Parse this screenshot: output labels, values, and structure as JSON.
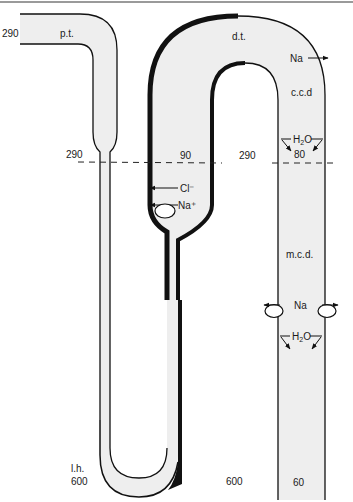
{
  "diagram": {
    "colors": {
      "tube_fill": "#eeeeee",
      "outline": "#111111",
      "background": "#ffffff",
      "top_rule": "#9a9a9a"
    },
    "segments": {
      "pt": "p.t.",
      "dt": "d.t.",
      "ccd": "c.c.d",
      "mcd": "m.c.d.",
      "lh": "l.h."
    },
    "values": {
      "pt_start": "290",
      "cortex_boundary_left": "290",
      "thick_ascending": "90",
      "interstitium_cortex": "290",
      "ccd_value": "80",
      "lh_tip": "600",
      "interstitium_medulla": "600",
      "mcd_end": "60"
    },
    "transport": {
      "dt_na": "Na",
      "ccd_h2o": "H2O",
      "tal_cl": "Cl⁻",
      "tal_na": "Na⁺",
      "mcd_na": "Na",
      "mcd_h2o": "H2O"
    },
    "boundary_line": "dashed"
  }
}
